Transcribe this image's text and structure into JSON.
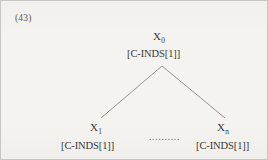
{
  "figure": {
    "example_number": "(43)",
    "type": "syntax-tree",
    "background_color": "#f4f3f0",
    "text_color": "#3a3836",
    "border_color": "#c8c6c2",
    "line_color": "#8a8884"
  },
  "tree": {
    "root": {
      "category": "X",
      "subscript": "0",
      "features": "[C-INDS[1]]"
    },
    "children": [
      {
        "category": "X",
        "subscript": "1",
        "features": "[C-INDS[1]]"
      },
      {
        "category": "X",
        "subscript": "n",
        "features": "[C-INDS[1]]"
      }
    ],
    "ellipsis": "..........",
    "branches": [
      {
        "name": "left-branch",
        "x1": 161,
        "y1": 65,
        "x2": 100,
        "y2": 117
      },
      {
        "name": "right-branch",
        "x1": 161,
        "y1": 65,
        "x2": 224,
        "y2": 117
      }
    ]
  }
}
